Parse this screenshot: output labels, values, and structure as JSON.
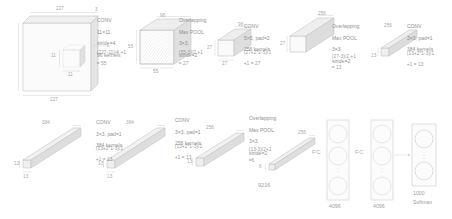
{
  "figure": {
    "type": "diagram",
    "style": "faint grayscale isometric block diagram"
  },
  "input": {
    "width_label": "227",
    "height_label": "227",
    "depth_label": "3",
    "patch_label_h": "11",
    "patch_label_w": "11"
  },
  "stages": [
    {
      "id": "conv1",
      "kind": "CONV",
      "lines": [
        "CONV",
        "11×11,",
        "stride=4,",
        "96 kernels"
      ],
      "equation": [
        "(227-11)/4 +1",
        "= 55"
      ],
      "out_w": "55",
      "out_h": "55",
      "out_d": "96"
    },
    {
      "id": "pool1",
      "kind": "POOL",
      "lines": [
        "Overlapping",
        "Max POOL",
        "3×3,",
        "stride=2"
      ],
      "equation": [
        "(55-3)/2 +1",
        "= 27"
      ],
      "out_w": "27",
      "out_h": "27",
      "out_d": "96"
    },
    {
      "id": "conv2",
      "kind": "CONV",
      "lines": [
        "CONV",
        "5×5, pad=2",
        "256 kernels"
      ],
      "equation": [
        "(27+2*2-5)/1",
        "+1 = 27"
      ],
      "out_w": "27",
      "out_h": "27",
      "out_d": "256"
    },
    {
      "id": "pool2",
      "kind": "POOL",
      "lines": [
        "Overlapping",
        "Max POOL",
        "3×3,",
        "stride=2"
      ],
      "equation": [
        "(27-3)/2 +1",
        "= 13"
      ],
      "out_w": "13",
      "out_h": "13",
      "out_d": "256"
    },
    {
      "id": "conv3",
      "kind": "CONV",
      "lines": [
        "CONV",
        "3×3, pad=1",
        "384 kernels"
      ],
      "equation": [
        "(13+2*1-3)/1",
        "+1 = 13"
      ],
      "out_w": "13",
      "out_h": "13",
      "out_d": "384"
    },
    {
      "id": "conv4",
      "kind": "CONV",
      "lines": [
        "CONV",
        "3×3, pad=1",
        "384 kernels"
      ],
      "equation": [
        "(13+2*1-3)/1",
        "+1 = 13"
      ],
      "out_w": "13",
      "out_h": "13",
      "out_d": "384"
    },
    {
      "id": "conv5",
      "kind": "CONV",
      "lines": [
        "CONV",
        "3×3, pad=1",
        "256 kernels"
      ],
      "equation": [
        "(13+2*1-3)/1",
        "+1 = 13"
      ],
      "out_w": "13",
      "out_h": "13",
      "out_d": "256"
    },
    {
      "id": "pool3",
      "kind": "POOL",
      "lines": [
        "Overlapping",
        "Max POOL",
        "3×3,",
        "stride=2"
      ],
      "equation": [
        "(13-3)/2+1",
        "=6"
      ],
      "out_w": "6",
      "out_h": "6",
      "out_d": "256"
    }
  ],
  "flatten": {
    "label": "9216"
  },
  "fc_layers": [
    {
      "label": "FC",
      "units": "4096"
    },
    {
      "label": "FC",
      "units": "4096"
    }
  ],
  "output": {
    "units": "1000",
    "activation": "Softmax"
  },
  "colors": {
    "stroke": "#bfbfbf",
    "fill_light": "#f2f2f2",
    "fill_mid": "#e6e6e6",
    "fill_dark": "#dadada",
    "text": "#9a9a9a",
    "background": "#ffffff"
  }
}
